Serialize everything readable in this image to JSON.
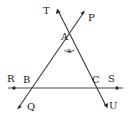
{
  "figure": {
    "stroke_color": "#3a3a3a",
    "text_color": "#1a1a1a",
    "background_color": "#ffffff",
    "width": 128,
    "height": 119
  },
  "labels": {
    "T": "T",
    "P": "P",
    "A": "A",
    "angle_x": "x",
    "R": "R",
    "B": "B",
    "C": "C",
    "S": "S",
    "Q": "Q",
    "U": "U"
  },
  "label_positions": {
    "T": {
      "x": 43,
      "y": 6
    },
    "P": {
      "x": 88,
      "y": 13
    },
    "A": {
      "x": 61,
      "y": 32
    },
    "angle_x": {
      "x": 67,
      "y": 47
    },
    "R": {
      "x": 7,
      "y": 74
    },
    "B": {
      "x": 23,
      "y": 75
    },
    "C": {
      "x": 92,
      "y": 75
    },
    "S": {
      "x": 108,
      "y": 74
    },
    "Q": {
      "x": 27,
      "y": 102
    },
    "U": {
      "x": 109,
      "y": 101
    }
  },
  "points": {
    "A": {
      "x": 69,
      "y": 41
    },
    "B": {
      "x": 32,
      "y": 88
    },
    "C": {
      "x": 97,
      "y": 88
    },
    "T_tip": {
      "x": 57,
      "y": 9
    },
    "P_tip": {
      "x": 85,
      "y": 11
    },
    "Q_tip": {
      "x": 17,
      "y": 109
    },
    "U_tip": {
      "x": 107,
      "y": 107
    },
    "R_dot": {
      "x": 14,
      "y": 88
    },
    "S_dot": {
      "x": 117,
      "y": 88
    },
    "line_left_end": {
      "x": 8,
      "y": 88
    },
    "line_right_end": {
      "x": 123,
      "y": 88
    }
  },
  "lines": [
    {
      "name": "line-RS",
      "from": "R",
      "to": "S",
      "kind": "segment-with-endpoint-dots"
    },
    {
      "name": "line-QP",
      "from": "Q",
      "to": "P",
      "kind": "double-arrow-transversal"
    },
    {
      "name": "line-TU",
      "from": "T",
      "to": "U",
      "kind": "double-arrow-transversal"
    }
  ]
}
